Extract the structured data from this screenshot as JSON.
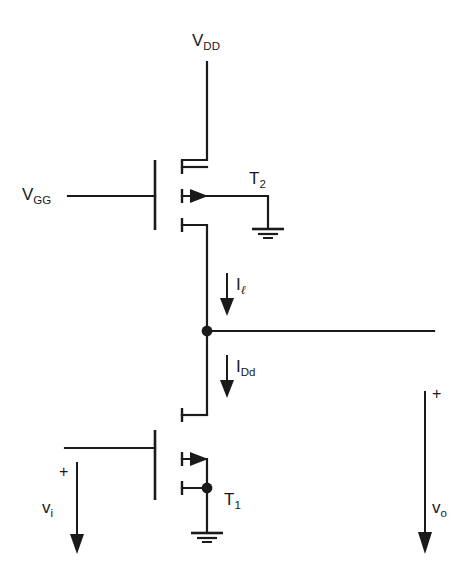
{
  "diagram": {
    "background_color": "#ffffff",
    "line_color": "#1a1a1a"
  },
  "labels": {
    "vdd": {
      "base": "V",
      "sub": "DD",
      "text": "VDD"
    },
    "vgg": {
      "base": "V",
      "sub": "GG",
      "text": "VGG"
    },
    "t2": {
      "base": "T",
      "sub": "2",
      "text": "T2"
    },
    "t1": {
      "base": "T",
      "sub": "1",
      "text": "T1"
    },
    "current_load": {
      "base": "I",
      "sub": "ℓ",
      "text": "Iℓ"
    },
    "current_drain": {
      "base": "I",
      "sub": "Dd",
      "text": "IDd"
    },
    "vi": {
      "base": "v",
      "sub": "i",
      "text": "vi"
    },
    "vo": {
      "base": "v",
      "sub": "o",
      "text": "vo"
    },
    "plus_input": "+",
    "plus_output": "+"
  },
  "components": [
    {
      "name": "transistor-t2",
      "type": "mosfet",
      "label": "T2",
      "role": "load"
    },
    {
      "name": "transistor-t1",
      "type": "mosfet",
      "label": "T1",
      "role": "driver"
    },
    {
      "name": "ground-t2",
      "type": "ground"
    },
    {
      "name": "ground-t1",
      "type": "ground"
    },
    {
      "name": "output-node",
      "type": "junction"
    },
    {
      "name": "source-node-t1",
      "type": "junction"
    }
  ],
  "nets": [
    {
      "name": "vdd-rail",
      "from": "VDD",
      "to": "T2 drain"
    },
    {
      "name": "vgg-gate",
      "from": "VGG",
      "to": "T2 gate"
    },
    {
      "name": "t2-source-to-output",
      "from": "T2 source",
      "to": "output node"
    },
    {
      "name": "output-to-t1-drain",
      "from": "output node",
      "to": "T1 drain"
    },
    {
      "name": "output-line",
      "from": "output node",
      "to": "right edge"
    },
    {
      "name": "vi-gate",
      "from": "vi",
      "to": "T1 gate"
    },
    {
      "name": "t1-source-ground",
      "from": "T1 source",
      "to": "ground"
    }
  ]
}
